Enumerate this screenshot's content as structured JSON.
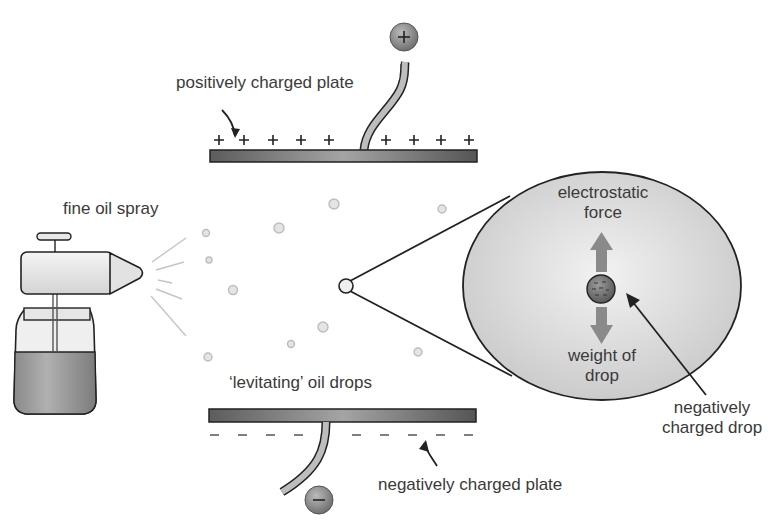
{
  "diagram": {
    "labels": {
      "positive_plate": "positively charged plate",
      "fine_oil_spray": "fine oil spray",
      "levitating_drops": "‘levitating’ oil drops",
      "negative_plate": "negatively charged plate",
      "electrostatic_force_line1": "electrostatic",
      "electrostatic_force_line2": "force",
      "weight_line1": "weight of",
      "weight_line2": "drop",
      "charged_drop_line1": "negatively",
      "charged_drop_line2": "charged drop"
    },
    "symbols": {
      "positive_terminal": "+",
      "negative_terminal": "−"
    },
    "colors": {
      "plate": "#6a6a6a",
      "plate_highlight": "#a8a8a8",
      "magnifier_fill": "#d6d6d6",
      "arrow": "#8a8a8a",
      "outline": "#222222",
      "droplet": "#cfcfcf",
      "liquid": "#9a9a9a"
    }
  }
}
